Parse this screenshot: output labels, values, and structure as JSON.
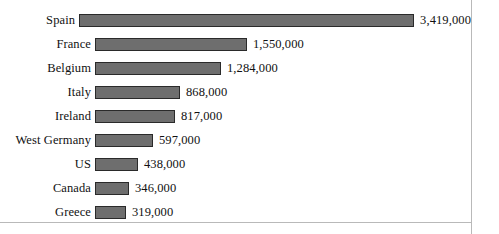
{
  "chart_data": {
    "type": "bar",
    "orientation": "horizontal",
    "title": "",
    "subtitle": "",
    "xlabel": "",
    "ylabel": "",
    "grid": false,
    "legend": false,
    "legend_position": "none",
    "axis_tick_labels": [],
    "xlim": [
      0,
      3419000
    ],
    "categories": [
      "Spain",
      "France",
      "Belgium",
      "Italy",
      "Ireland",
      "West Germany",
      "US",
      "Canada",
      "Greece"
    ],
    "values": [
      3419000,
      1550000,
      1284000,
      868000,
      817000,
      597000,
      438000,
      346000,
      319000
    ],
    "value_labels": [
      "3,419,000",
      "1,550,000",
      "1,284,000",
      "868,000",
      "817,000",
      "597,000",
      "438,000",
      "346,000",
      "319,000"
    ],
    "bars": [
      {
        "category": "Spain",
        "value": 3419000,
        "label": "3,419,000"
      },
      {
        "category": "France",
        "value": 1550000,
        "label": "1,550,000"
      },
      {
        "category": "Belgium",
        "value": 1284000,
        "label": "1,284,000"
      },
      {
        "category": "Italy",
        "value": 868000,
        "label": "868,000"
      },
      {
        "category": "Ireland",
        "value": 817000,
        "label": "817,000"
      },
      {
        "category": "West Germany",
        "value": 597000,
        "label": "597,000"
      },
      {
        "category": "US",
        "value": 438000,
        "label": "438,000"
      },
      {
        "category": "Canada",
        "value": 346000,
        "label": "346,000"
      },
      {
        "category": "Greece",
        "value": 319000,
        "label": "319,000"
      }
    ],
    "colors": {
      "bar_fill": "#6e6e6e",
      "bar_border": "#2a2a2a",
      "text": "#111111",
      "background": "#ffffff",
      "frame_rule": "#b9b9b9"
    },
    "layout": {
      "bar_origin_x": 95,
      "pixels_per_unit": 9.8e-05,
      "row_pitch": 24,
      "first_row_top": 8,
      "bar_height": 13
    }
  }
}
